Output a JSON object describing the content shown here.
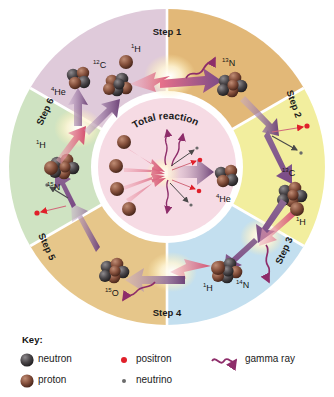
{
  "figure": {
    "background_color": "#ffffff"
  },
  "center": {
    "title": "Total reaction",
    "product_label_sup": "4",
    "product_label_sym": "He",
    "proton_count": 4,
    "fill_color": "#f6dbe4"
  },
  "steps": [
    {
      "id": "step-1",
      "label": "Step 1",
      "color": "#e2b878",
      "reactant_sup": "1",
      "reactant_sym": "H",
      "input_sup": "12",
      "input_sym": "C",
      "product_sup": "13",
      "product_sym": "N",
      "emits": [
        "gamma ray"
      ]
    },
    {
      "id": "step-2",
      "label": "Step 2",
      "color": "#f2ee9e",
      "product_sup": "13",
      "product_sym": "C",
      "emits": [
        "positron",
        "neutrino"
      ]
    },
    {
      "id": "step-3",
      "label": "Step 3",
      "color": "#c3dfef",
      "reactant_sup": "1",
      "reactant_sym": "H",
      "product_sup": "14",
      "product_sym": "N",
      "emits": [
        "gamma ray"
      ]
    },
    {
      "id": "step-4",
      "label": "Step 4",
      "color": "#e6c68a",
      "reactant_sup": "1",
      "reactant_sym": "H",
      "product_sup": "15",
      "product_sym": "O",
      "emits": [
        "gamma ray"
      ]
    },
    {
      "id": "step-5",
      "label": "Step 5",
      "color": "#cfe3c2",
      "product_sup": "15",
      "product_sym": "N",
      "emits": [
        "positron",
        "neutrino"
      ]
    },
    {
      "id": "step-6",
      "label": "Step 6",
      "color": "#dfcada",
      "reactant_sup": "1",
      "reactant_sym": "H",
      "product_sup": "12",
      "product_sym": "C",
      "product2_sup": "4",
      "product2_sym": "He",
      "emits": []
    }
  ],
  "key": {
    "heading": "Key:",
    "items": [
      {
        "id": "neutron",
        "label": "neutron",
        "color": "#3d3a3c"
      },
      {
        "id": "proton",
        "label": "proton",
        "color": "#7b4334"
      },
      {
        "id": "positron",
        "label": "positron",
        "color": "#e0202a"
      },
      {
        "id": "neutrino",
        "label": "neutrino",
        "color": "#6b6b6b"
      },
      {
        "id": "gamma-ray",
        "label": "gamma ray",
        "color": "#8e2d6a"
      }
    ]
  }
}
